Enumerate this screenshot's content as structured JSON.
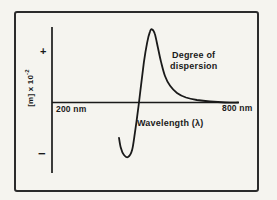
{
  "figure": {
    "y_axis": {
      "label_base": "[m] x 10",
      "label_exponent": "-2",
      "plus_marker": "+",
      "minus_marker": "−"
    },
    "x_axis": {
      "left_label": "200 nm",
      "right_label": "800 nm",
      "title": "Wavelength (λ)"
    },
    "annotation": {
      "line1": "Degree of",
      "line2": "dispersion"
    }
  },
  "colors": {
    "ink": "#1a1a1a",
    "paper": "#f5f4ef",
    "frame": "#2b2b2b"
  },
  "chart_data": {
    "type": "line",
    "title": "",
    "xlabel": "Wavelength (λ)",
    "ylabel": "[m] x 10^-2",
    "x_unit": "nm",
    "xlim": [
      200,
      800
    ],
    "ylim": [
      -1.5,
      1.6
    ],
    "grid": false,
    "legend": "none",
    "annotations": [
      "Degree of dispersion"
    ],
    "series": [
      {
        "name": "ORD Cotton effect curve (degree of dispersion)",
        "x": [
          415,
          421,
          431,
          444,
          457,
          466,
          476,
          486,
          495,
          505,
          514,
          521,
          530,
          540,
          550,
          563,
          579,
          601,
          630,
          665,
          707,
          755,
          797
        ],
        "y": [
          -0.7,
          -0.9,
          -1.04,
          -1.08,
          -0.94,
          -0.6,
          -0.15,
          0.35,
          0.8,
          1.18,
          1.4,
          1.45,
          1.36,
          1.08,
          0.8,
          0.52,
          0.33,
          0.19,
          0.1,
          0.05,
          0.02,
          0.0,
          0.0
        ]
      }
    ]
  }
}
